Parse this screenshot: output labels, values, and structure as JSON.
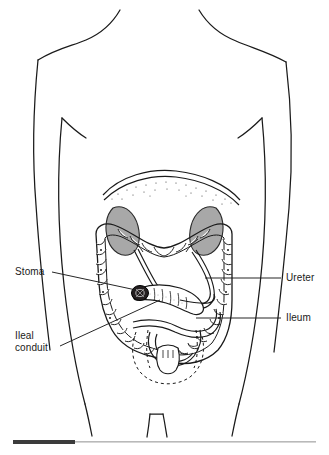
{
  "figure": {
    "kind": "medical-illustration",
    "background_color": "#ffffff",
    "line_color": "#1a1a1a",
    "organ_fill_gray": "#a8a8a8",
    "stoma_color": "#241f20"
  },
  "labels": {
    "stoma": "Stoma",
    "ileal_conduit_line1": "Ileal",
    "ileal_conduit_line2": "conduit",
    "ureter": "Ureter",
    "ileum": "Ileum"
  },
  "footer_rule": {
    "dark_segment_color": "#3b3b3b",
    "light_segment_color": "#b9b9b9"
  }
}
